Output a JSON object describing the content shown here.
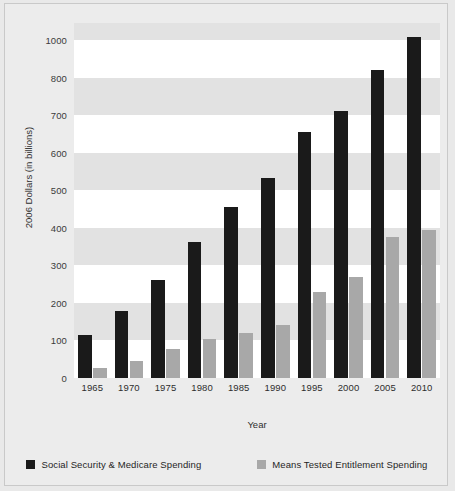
{
  "chart_data": {
    "type": "bar",
    "title": "",
    "xlabel": "Year",
    "ylabel": "2006 Dollars (in billions)",
    "categories": [
      "1965",
      "1970",
      "1975",
      "1980",
      "1985",
      "1990",
      "1995",
      "2000",
      "2005",
      "2010"
    ],
    "ytick_labels": [
      "0",
      "100",
      "200",
      "300",
      "400",
      "500",
      "600",
      "700",
      "800",
      "1000"
    ],
    "ytick_values": [
      0,
      100,
      200,
      300,
      400,
      500,
      600,
      700,
      800,
      1000
    ],
    "ylim": [
      0,
      1050
    ],
    "grid": "alternating horizontal bands every 100 units",
    "legend_position": "bottom-center",
    "series": [
      {
        "name": "Social Security & Medicare Spending",
        "color": "#1a1a1a",
        "values": [
          115,
          178,
          262,
          362,
          455,
          533,
          655,
          710,
          838,
          1015
        ]
      },
      {
        "name": "Means Tested Entitlement Spending",
        "color": "#a8a8a8",
        "values": [
          28,
          45,
          78,
          105,
          120,
          140,
          228,
          270,
          375,
          393
        ]
      }
    ]
  }
}
